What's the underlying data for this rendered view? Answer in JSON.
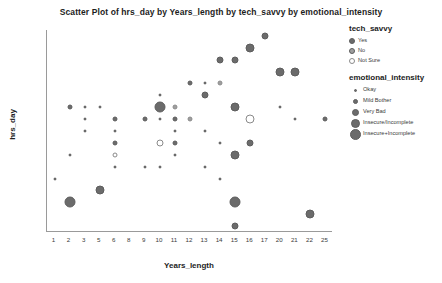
{
  "chart_data": {
    "type": "scatter",
    "title": "Scatter Plot of hrs_day by Years_length by tech_savvy by emotional_intensity",
    "xlabel": "Years_length",
    "ylabel": "hrs_day",
    "grid": false,
    "x_ticks": [
      "1",
      "2",
      "3",
      "5",
      "6",
      "8",
      "9",
      "10",
      "11",
      "12",
      "13",
      "14",
      "15",
      "16",
      "17",
      "20",
      "21",
      "22",
      "25"
    ],
    "y_ticks": [
      "20",
      "18",
      "16",
      "15",
      "14",
      "13",
      "12",
      "11",
      "10",
      "9",
      "8",
      "7",
      "6",
      "5",
      "4",
      "3",
      "2"
    ],
    "legend_position": "right",
    "size_legend_title": "emotional_intensity",
    "color_legend_title": "tech_savvy",
    "points": [
      {
        "x": "17",
        "y": "20",
        "color": "Yes",
        "size": "Very Bad"
      },
      {
        "x": "16",
        "y": "18",
        "color": "Yes",
        "size": "Insecure/Incomplete"
      },
      {
        "x": "14",
        "y": "16",
        "color": "Yes",
        "size": "Very Bad"
      },
      {
        "x": "15",
        "y": "16",
        "color": "Yes",
        "size": "Very Bad"
      },
      {
        "x": "20",
        "y": "15",
        "color": "Yes",
        "size": "Insecure/Incomplete"
      },
      {
        "x": "21",
        "y": "15",
        "color": "Yes",
        "size": "Insecure/Incomplete"
      },
      {
        "x": "12",
        "y": "14",
        "color": "Yes",
        "size": "Mild Bother"
      },
      {
        "x": "13",
        "y": "14",
        "color": "Yes",
        "size": "Okay"
      },
      {
        "x": "14",
        "y": "14",
        "color": "No",
        "size": "Mild Bother"
      },
      {
        "x": "10",
        "y": "13",
        "color": "Yes",
        "size": "Okay"
      },
      {
        "x": "13",
        "y": "13",
        "color": "Yes",
        "size": "Very Bad"
      },
      {
        "x": "2",
        "y": "12",
        "color": "Yes",
        "size": "Mild Bother"
      },
      {
        "x": "3",
        "y": "12",
        "color": "Yes",
        "size": "Okay"
      },
      {
        "x": "5",
        "y": "12",
        "color": "Yes",
        "size": "Okay"
      },
      {
        "x": "10",
        "y": "12",
        "color": "Yes",
        "size": "Insecure+Incomplete"
      },
      {
        "x": "11",
        "y": "12",
        "color": "No",
        "size": "Mild Bother"
      },
      {
        "x": "15",
        "y": "12",
        "color": "Yes",
        "size": "Insecure/Incomplete"
      },
      {
        "x": "20",
        "y": "12",
        "color": "Yes",
        "size": "Okay"
      },
      {
        "x": "12",
        "y": "11",
        "color": "Yes",
        "size": "Okay"
      },
      {
        "x": "3",
        "y": "11",
        "color": "Yes",
        "size": "Okay"
      },
      {
        "x": "6",
        "y": "11",
        "color": "Yes",
        "size": "Mild Bother"
      },
      {
        "x": "9",
        "y": "11",
        "color": "Yes",
        "size": "Mild Bother"
      },
      {
        "x": "10",
        "y": "11",
        "color": "Yes",
        "size": "Okay"
      },
      {
        "x": "11",
        "y": "11",
        "color": "Yes",
        "size": "Mild Bother"
      },
      {
        "x": "12",
        "y": "11",
        "color": "No",
        "size": "Mild Bother"
      },
      {
        "x": "16",
        "y": "11",
        "color": "Not Sure",
        "size": "Insecure/Incomplete"
      },
      {
        "x": "21",
        "y": "11",
        "color": "Yes",
        "size": "Okay"
      },
      {
        "x": "25",
        "y": "11",
        "color": "Yes",
        "size": "Mild Bother"
      },
      {
        "x": "6",
        "y": "10",
        "color": "Yes",
        "size": "Okay"
      },
      {
        "x": "13",
        "y": "10",
        "color": "Yes",
        "size": "Okay"
      },
      {
        "x": "3",
        "y": "10",
        "color": "Yes",
        "size": "Okay"
      },
      {
        "x": "11",
        "y": "10",
        "color": "Yes",
        "size": "Okay"
      },
      {
        "x": "6",
        "y": "9",
        "color": "Yes",
        "size": "Mild Bother"
      },
      {
        "x": "11",
        "y": "9",
        "color": "Mild Bother",
        "size": "Mild Bother"
      },
      {
        "x": "10",
        "y": "9",
        "color": "Not Sure",
        "size": "Very Bad"
      },
      {
        "x": "14",
        "y": "9",
        "color": "Yes",
        "size": "Okay"
      },
      {
        "x": "16",
        "y": "9",
        "color": "Yes",
        "size": "Very Bad"
      },
      {
        "x": "2",
        "y": "8",
        "color": "Yes",
        "size": "Okay"
      },
      {
        "x": "6",
        "y": "8",
        "color": "Not Sure",
        "size": "Mild Bother"
      },
      {
        "x": "11",
        "y": "8",
        "color": "Yes",
        "size": "Okay"
      },
      {
        "x": "15",
        "y": "8",
        "color": "Yes",
        "size": "Insecure/Incomplete"
      },
      {
        "x": "6",
        "y": "7",
        "color": "Yes",
        "size": "Okay"
      },
      {
        "x": "9",
        "y": "7",
        "color": "Yes",
        "size": "Okay"
      },
      {
        "x": "10",
        "y": "7",
        "color": "Yes",
        "size": "Okay"
      },
      {
        "x": "13",
        "y": "7",
        "color": "Yes",
        "size": "Okay"
      },
      {
        "x": "1",
        "y": "6",
        "color": "Yes",
        "size": "Okay"
      },
      {
        "x": "14",
        "y": "6",
        "color": "Yes",
        "size": "Okay"
      },
      {
        "x": "5",
        "y": "5",
        "color": "Yes",
        "size": "Insecure/Incomplete"
      },
      {
        "x": "15",
        "y": "4",
        "color": "Yes",
        "size": "Insecure+Incomplete"
      },
      {
        "x": "2",
        "y": "4",
        "color": "Yes",
        "size": "Insecure+Incomplete"
      },
      {
        "x": "22",
        "y": "3",
        "color": "Yes",
        "size": "Insecure/Incomplete"
      },
      {
        "x": "15",
        "y": "2",
        "color": "Yes",
        "size": "Very Bad"
      }
    ]
  },
  "color_legend": {
    "title": "tech_savvy",
    "items": [
      {
        "label": "Yes",
        "color": "#6b6b6b"
      },
      {
        "label": "No",
        "color": "#9e9e9e"
      },
      {
        "label": "Not Sure",
        "color": "#ffffff"
      }
    ]
  },
  "size_legend": {
    "title": "emotional_intensity",
    "items": [
      {
        "label": "Okay",
        "size": 3
      },
      {
        "label": "Mild Bother",
        "size": 5
      },
      {
        "label": "Very Bad",
        "size": 7
      },
      {
        "label": "Insecure/Incomplete",
        "size": 9
      },
      {
        "label": "Insecure+Incomplete",
        "size": 11
      }
    ]
  }
}
